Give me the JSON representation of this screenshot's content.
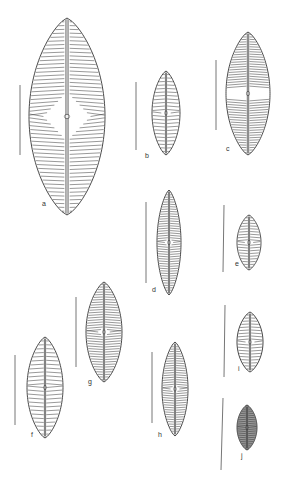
{
  "figure": {
    "line_color": "#333333",
    "scale_bar_color": "#777777",
    "specimens": [
      {
        "label": "a",
        "cx": 67,
        "top": 18,
        "bottom": 215,
        "halfwidth": 38,
        "striae": 52,
        "central_area": "large"
      },
      {
        "label": "b",
        "cx": 166,
        "top": 71,
        "bottom": 155,
        "halfwidth": 14,
        "striae": 24,
        "central_area": "small"
      },
      {
        "label": "c",
        "cx": 248,
        "top": 32,
        "bottom": 155,
        "halfwidth": 22,
        "striae": 50,
        "central_area": "fascia"
      },
      {
        "label": "d",
        "cx": 169,
        "top": 190,
        "bottom": 295,
        "halfwidth": 12,
        "striae": 44,
        "central_area": "small"
      },
      {
        "label": "e",
        "cx": 249,
        "top": 215,
        "bottom": 270,
        "halfwidth": 12,
        "striae": 20,
        "central_area": "small"
      },
      {
        "label": "f",
        "cx": 45,
        "top": 337,
        "bottom": 438,
        "halfwidth": 18,
        "striae": 26,
        "central_area": "none"
      },
      {
        "label": "g",
        "cx": 104,
        "top": 282,
        "bottom": 382,
        "halfwidth": 18,
        "striae": 40,
        "central_area": "small"
      },
      {
        "label": "h",
        "cx": 175,
        "top": 342,
        "bottom": 436,
        "halfwidth": 13,
        "striae": 40,
        "central_area": "small"
      },
      {
        "label": "i",
        "cx": 250,
        "top": 312,
        "bottom": 372,
        "halfwidth": 13,
        "striae": 20,
        "central_area": "small"
      },
      {
        "label": "j",
        "cx": 247,
        "top": 405,
        "bottom": 450,
        "halfwidth": 10,
        "striae": 22,
        "central_area": "none",
        "dense": true
      }
    ],
    "scale_bars": [
      {
        "for": "a",
        "x1": 20,
        "y1": 85,
        "x2": 20,
        "y2": 155
      },
      {
        "for": "b",
        "x1": 136,
        "y1": 82,
        "x2": 136,
        "y2": 150
      },
      {
        "for": "c",
        "x1": 216,
        "y1": 60,
        "x2": 216,
        "y2": 130
      },
      {
        "for": "d",
        "x1": 146,
        "y1": 202,
        "x2": 146,
        "y2": 283
      },
      {
        "for": "e",
        "x1": 224,
        "y1": 205,
        "x2": 223,
        "y2": 272
      },
      {
        "for": "f",
        "x1": 15,
        "y1": 355,
        "x2": 15,
        "y2": 425
      },
      {
        "for": "g",
        "x1": 76,
        "y1": 297,
        "x2": 76,
        "y2": 367
      },
      {
        "for": "h",
        "x1": 152,
        "y1": 352,
        "x2": 152,
        "y2": 423
      },
      {
        "for": "i",
        "x1": 225,
        "y1": 305,
        "x2": 224,
        "y2": 377
      },
      {
        "for": "j",
        "x1": 223,
        "y1": 398,
        "x2": 221,
        "y2": 470
      }
    ],
    "labels": [
      {
        "text": "a",
        "x": 42,
        "y": 200
      },
      {
        "text": "b",
        "x": 145,
        "y": 152
      },
      {
        "text": "c",
        "x": 226,
        "y": 145
      },
      {
        "text": "d",
        "x": 152,
        "y": 286
      },
      {
        "text": "e",
        "x": 235,
        "y": 260
      },
      {
        "text": "f",
        "x": 31,
        "y": 431
      },
      {
        "text": "g",
        "x": 88,
        "y": 378
      },
      {
        "text": "h",
        "x": 158,
        "y": 431
      },
      {
        "text": "i",
        "x": 238,
        "y": 365
      },
      {
        "text": "j",
        "x": 241,
        "y": 452
      }
    ]
  }
}
